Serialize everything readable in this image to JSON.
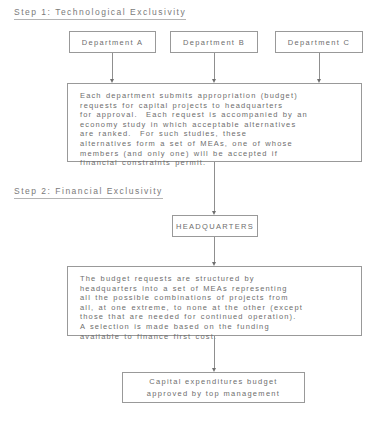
{
  "diagram": {
    "steps": [
      {
        "heading": "Step 1:  Technological Exclusivity",
        "detail": "Each department submits appropriation (budget)\nrequests for capital projects to headquarters\nfor approval.  Each request is accompanied by an\neconomy study in which acceptable alternatives\nare ranked.  For such studies, these\nalternatives form a set of MEAs, one of whose\nmembers (and only one) will be accepted if\nfinancial constraints permit."
      },
      {
        "heading": "Step 2:  Financial Exclusivity",
        "detail": "The budget requests are structured by\nheadquarters into a set of MEAs representing\nall the possible combinations of projects from\nall, at one extreme, to none at the other (except\nthose that are needed for continued operation).\nA selection is made based on the funding\navailable to finance first cost."
      }
    ],
    "departments": [
      {
        "label": "Department A"
      },
      {
        "label": "Department B"
      },
      {
        "label": "Department C"
      }
    ],
    "headquarters": {
      "label": "HEADQUARTERS"
    },
    "result": {
      "label": "Capital expenditures budget\napproved by top management"
    },
    "colors": {
      "ink": "#6e6e6e",
      "line": "#999999",
      "arrow": "#6f6f6f",
      "background": "#ffffff"
    }
  }
}
